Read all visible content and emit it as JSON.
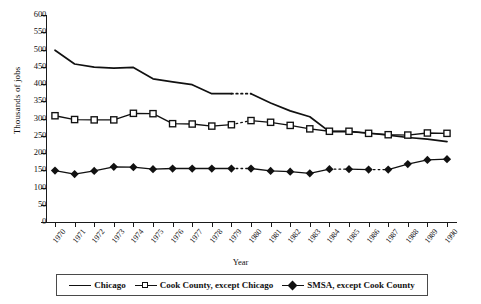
{
  "chart_data": {
    "type": "line",
    "title": "",
    "xlabel": "Year",
    "ylabel": "Thousands of jobs",
    "ylim": [
      0,
      600
    ],
    "ytick_step": 50,
    "yticks": [
      600,
      550,
      500,
      450,
      400,
      350,
      300,
      250,
      200,
      150,
      100,
      50,
      0
    ],
    "grid": false,
    "legend_position": "bottom",
    "categories": [
      "1970",
      "1971",
      "1972",
      "1973",
      "1974",
      "1975",
      "1976",
      "1977",
      "1978",
      "1979",
      "1980",
      "1981",
      "1982",
      "1983",
      "1984",
      "1985",
      "1986",
      "1987",
      "1988",
      "1989",
      "1990"
    ],
    "break_between": [
      "1979",
      "1980"
    ],
    "series": [
      {
        "name": "Chicago",
        "marker": "none",
        "color": "#111111",
        "values": [
          498,
          458,
          449,
          446,
          448,
          415,
          406,
          398,
          372,
          372,
          372,
          345,
          322,
          305,
          262,
          262,
          258,
          252,
          245,
          240,
          233
        ]
      },
      {
        "name": "Cook County, except Chicago",
        "marker": "open-square",
        "color": "#111111",
        "values": [
          308,
          297,
          296,
          296,
          315,
          314,
          285,
          284,
          278,
          282,
          294,
          289,
          280,
          270,
          263,
          263,
          257,
          253,
          252,
          258,
          257
        ]
      },
      {
        "name": "SMSA, except Cook County",
        "marker": "filled-diamond",
        "color": "#111111",
        "values": [
          149,
          139,
          148,
          160,
          159,
          153,
          155,
          155,
          155,
          155,
          155,
          148,
          146,
          141,
          153,
          153,
          152,
          152,
          168,
          180,
          182
        ]
      }
    ]
  },
  "legend": {
    "entries": [
      {
        "label": "Chicago",
        "key": "line"
      },
      {
        "label": "Cook County, except Chicago",
        "key": "open-square"
      },
      {
        "label": "SMSA, except Cook County",
        "key": "filled-diamond"
      }
    ]
  },
  "axes": {
    "y_title": "Thousands of jobs",
    "x_title": "Year"
  }
}
